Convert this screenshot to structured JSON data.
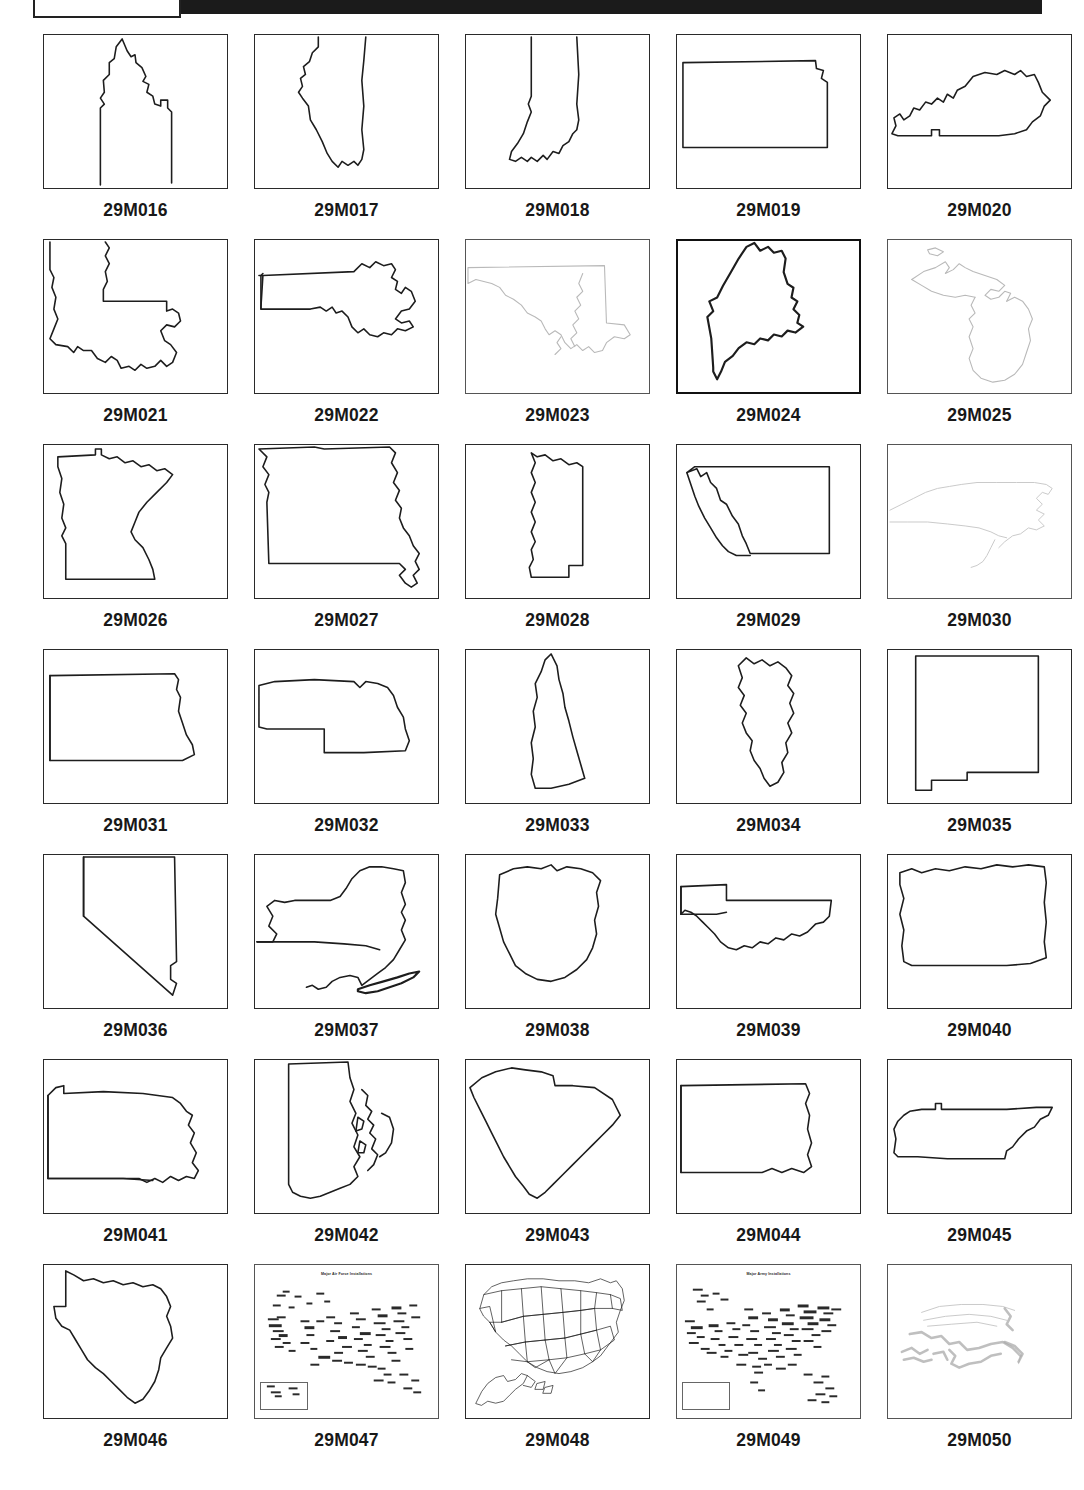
{
  "document": {
    "type": "microfiche-contact-sheet",
    "header_label": "",
    "title": "Outline Map Slide Contact Sheet"
  },
  "grid": {
    "columns": 5,
    "rows": 7
  },
  "cells": [
    {
      "id": "29M016",
      "subject": "Idaho",
      "style": "normal"
    },
    {
      "id": "29M017",
      "subject": "Illinois",
      "style": "normal"
    },
    {
      "id": "29M018",
      "subject": "Indiana",
      "style": "normal"
    },
    {
      "id": "29M019",
      "subject": "Kansas",
      "style": "normal"
    },
    {
      "id": "29M020",
      "subject": "Kentucky",
      "style": "normal"
    },
    {
      "id": "29M021",
      "subject": "Louisiana",
      "style": "normal"
    },
    {
      "id": "29M022",
      "subject": "Massachusetts",
      "style": "normal"
    },
    {
      "id": "29M023",
      "subject": "Maryland",
      "style": "faint"
    },
    {
      "id": "29M024",
      "subject": "Maine",
      "style": "heavy"
    },
    {
      "id": "29M025",
      "subject": "Michigan",
      "style": "faint"
    },
    {
      "id": "29M026",
      "subject": "Minnesota",
      "style": "normal"
    },
    {
      "id": "29M027",
      "subject": "Missouri",
      "style": "normal"
    },
    {
      "id": "29M028",
      "subject": "Mississippi",
      "style": "normal"
    },
    {
      "id": "29M029",
      "subject": "Montana",
      "style": "normal"
    },
    {
      "id": "29M030",
      "subject": "North Carolina",
      "style": "veryfaint"
    },
    {
      "id": "29M031",
      "subject": "North Dakota",
      "style": "normal"
    },
    {
      "id": "29M032",
      "subject": "Nebraska",
      "style": "normal"
    },
    {
      "id": "29M033",
      "subject": "New Hampshire",
      "style": "normal"
    },
    {
      "id": "29M034",
      "subject": "New Jersey",
      "style": "normal"
    },
    {
      "id": "29M035",
      "subject": "New Mexico",
      "style": "normal"
    },
    {
      "id": "29M036",
      "subject": "Nevada",
      "style": "normal"
    },
    {
      "id": "29M037",
      "subject": "New York",
      "style": "normal"
    },
    {
      "id": "29M038",
      "subject": "Ohio",
      "style": "normal"
    },
    {
      "id": "29M039",
      "subject": "Oklahoma",
      "style": "normal"
    },
    {
      "id": "29M040",
      "subject": "Oregon",
      "style": "normal"
    },
    {
      "id": "29M041",
      "subject": "Pennsylvania",
      "style": "normal"
    },
    {
      "id": "29M042",
      "subject": "Rhode Island",
      "style": "normal"
    },
    {
      "id": "29M043",
      "subject": "South Carolina",
      "style": "normal"
    },
    {
      "id": "29M044",
      "subject": "South Dakota",
      "style": "normal"
    },
    {
      "id": "29M045",
      "subject": "Tennessee",
      "style": "normal"
    },
    {
      "id": "29M046",
      "subject": "Texas",
      "style": "normal"
    },
    {
      "id": "29M047",
      "subject": "Major Air Force Installations",
      "style": "map"
    },
    {
      "id": "29M048",
      "subject": "United States — State Boundaries",
      "style": "map"
    },
    {
      "id": "29M049",
      "subject": "Major Army Installations",
      "style": "map"
    },
    {
      "id": "29M050",
      "subject": "United States — faded outline",
      "style": "ghost"
    }
  ],
  "inset_titles": {
    "air_force": "Major Air Force Installations",
    "army": "Major Army Installations"
  },
  "colors": {
    "page_background": "#ffffff",
    "ink": "#1d1d1d",
    "frame": "#2a2a2a",
    "header_bar": "#1b1b1b",
    "faint_ink": "#b9b9b9"
  }
}
